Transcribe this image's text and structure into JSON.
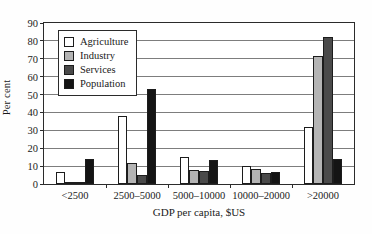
{
  "chart_data": {
    "type": "bar",
    "title": "",
    "subtitle": "",
    "xlabel": "GDP per capita, $US",
    "ylabel": "Per cent",
    "categories": [
      "<2500",
      "2500–5000",
      "5000–10000",
      "10000–20000",
      ">20000"
    ],
    "series": [
      {
        "name": "Agriculture",
        "color": "#ffffff",
        "values": [
          6.5,
          38,
          15,
          10,
          32
        ]
      },
      {
        "name": "Industry",
        "color": "#b4b4b4",
        "values": [
          1,
          12,
          8,
          8.5,
          71.5
        ]
      },
      {
        "name": "Services",
        "color": "#4a4a4a",
        "values": [
          0.5,
          5,
          7.5,
          6,
          82
        ]
      },
      {
        "name": "Population",
        "color": "#141414",
        "values": [
          14,
          53,
          13.5,
          6.5,
          14
        ]
      }
    ],
    "ylim": [
      0,
      90
    ],
    "yticks": [
      0,
      10,
      20,
      30,
      40,
      50,
      60,
      70,
      80,
      90
    ],
    "ytick_labels": [
      "0",
      "10",
      "20",
      "30",
      "40",
      "50",
      "60",
      "70",
      "80",
      "90"
    ],
    "grid": true,
    "grid_axis": "y",
    "legend_position": "upper left",
    "legend_entries": [
      "Agriculture",
      "Industry",
      "Services",
      "Population"
    ],
    "bar_edge_color": "#1c1c1c",
    "axis_color": "#2b2b2b",
    "gridline_color": "#7d7d7d"
  }
}
